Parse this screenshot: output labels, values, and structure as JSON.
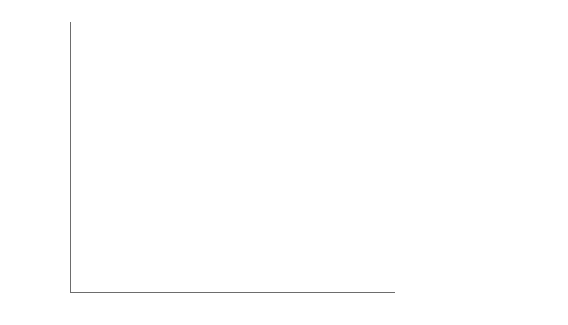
{
  "chart_data": {
    "type": "line",
    "title": "",
    "xlabel": "",
    "ylabel": "(Billion 2005 dollars)",
    "categories": [
      "1990",
      "2005",
      "2006",
      "2010",
      "2015",
      "2020",
      "2025",
      "2030"
    ],
    "ylim": [
      0,
      30000
    ],
    "yticks": [
      0,
      5000,
      10000,
      15000,
      20000,
      25000,
      30000
    ],
    "ytick_labels": [
      "0",
      "5000",
      "10,000",
      "15,000",
      "20,000",
      "25,000",
      "30,000"
    ],
    "grid": true,
    "legend_position": "right",
    "series": [
      {
        "name": "United States",
        "values": [
          8000,
          12700,
          13100,
          13400,
          15200,
          17400,
          19800,
          22400
        ],
        "color": "#8c8c8c",
        "width": 1.4
      },
      {
        "name": "Canada",
        "values": [
          800,
          1250,
          1300,
          1400,
          1700,
          2000,
          2300,
          2650
        ],
        "color": "#5a5a5a",
        "width": 1.2
      },
      {
        "name": "Mexico",
        "values": [
          700,
          1050,
          1100,
          1200,
          1500,
          1850,
          2250,
          2700
        ],
        "color": "#a8a8a8",
        "width": 1.2
      },
      {
        "name": "OECD Europe",
        "values": [
          9900,
          13900,
          14200,
          15000,
          16900,
          18900,
          21000,
          23100
        ],
        "color": "#1a1a1a",
        "width": 2.4
      },
      {
        "name": "Japan",
        "values": [
          3400,
          4500,
          4550,
          4600,
          4800,
          5000,
          5150,
          5300
        ],
        "color": "#7a7a7a",
        "width": 1.2
      },
      {
        "name": "South Korea",
        "values": [
          400,
          950,
          1000,
          1150,
          1450,
          1800,
          2150,
          2500
        ],
        "color": "#999999",
        "width": 1.2
      },
      {
        "name": "Australia/New Zealand",
        "values": [
          450,
          800,
          830,
          900,
          1100,
          1300,
          1550,
          1800
        ],
        "color": "#6e6e6e",
        "width": 1.2
      },
      {
        "name": "Russia",
        "values": [
          1200,
          1100,
          1200,
          1350,
          1700,
          2050,
          2400,
          2750
        ],
        "color": "#878787",
        "width": 1.3
      },
      {
        "name": "Other (Non-OECD Europe\nand Eurasia, ex Russia)",
        "values": [
          700,
          700,
          750,
          850,
          1050,
          1300,
          1550,
          1850
        ],
        "color": "#b0b0b0",
        "width": 1.2
      },
      {
        "name": "China",
        "values": [
          1000,
          5400,
          6100,
          9200,
          13600,
          18000,
          22500,
          26700
        ],
        "color": "#9b9b9b",
        "width": 1.5
      },
      {
        "name": "India",
        "values": [
          700,
          1600,
          1800,
          2500,
          4000,
          5800,
          7900,
          10300
        ],
        "color": "#a5a5a5",
        "width": 1.4
      },
      {
        "name": "Non-OECD Asia\n(ex India, China)",
        "values": [
          900,
          1900,
          2000,
          2400,
          3100,
          3900,
          4800,
          5800
        ],
        "color": "#8f8f8f",
        "width": 1.3
      },
      {
        "name": "Middle East",
        "values": [
          600,
          1200,
          1300,
          1600,
          2100,
          2700,
          3400,
          4200
        ],
        "color": "#c0c0c0",
        "width": 1.2
      },
      {
        "name": "Africa",
        "values": [
          600,
          1000,
          1050,
          1250,
          1650,
          2100,
          2650,
          3300
        ],
        "color": "#9e9e9e",
        "width": 1.2
      },
      {
        "name": "Brazil",
        "values": [
          700,
          1000,
          1050,
          1200,
          1500,
          1850,
          2250,
          2700
        ],
        "color": "#cccccc",
        "width": 1.2
      },
      {
        "name": "Central and South America\n(ex Brazil)",
        "values": [
          700,
          1100,
          1150,
          1350,
          1700,
          2100,
          2550,
          3050
        ],
        "color": "#b6b6b6",
        "width": 1.2
      }
    ]
  },
  "legend": {
    "items": [
      {
        "label": "United States"
      },
      {
        "label": "Canada"
      },
      {
        "label": "Mexico"
      },
      {
        "label": "OECD Europe"
      },
      {
        "label": "Japan"
      },
      {
        "label": "South Korea"
      },
      {
        "label": "Australia/New Zealand"
      },
      {
        "label": "Russia"
      },
      {
        "label": "Other (Non-OECD Europe\nand Eurasia, ex Russia)"
      },
      {
        "label": "China"
      },
      {
        "label": "India"
      },
      {
        "label": "Non-OECD Asia\n(ex India, China)"
      },
      {
        "label": "Middle East"
      },
      {
        "label": "Africa"
      },
      {
        "label": "Brazil"
      },
      {
        "label": "Central and South America\n(ex Brazil)"
      }
    ]
  }
}
